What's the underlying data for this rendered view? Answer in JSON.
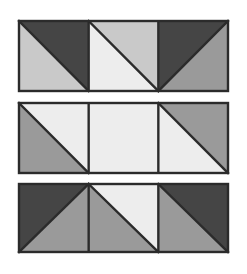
{
  "figure": {
    "canvas": {
      "width": 247,
      "height": 274,
      "background": "#ffffff"
    },
    "palette": {
      "outline": "#2b2b2b",
      "dark": "#454545",
      "mid": "#9a9a9a",
      "light": "#c9c9c9",
      "lighter": "#dcdcdc",
      "lightest": "#ededed",
      "background": "#ffffff"
    },
    "geometry": {
      "left": 19,
      "right": 228,
      "cell_width": 69.67,
      "stroke_width": 2.4,
      "bands": [
        {
          "name": "band-top",
          "top": 21,
          "bottom": 91
        },
        {
          "name": "band-middle",
          "top": 103,
          "bottom": 173
        },
        {
          "name": "band-bottom",
          "top": 184,
          "bottom": 252
        }
      ]
    },
    "bands": [
      {
        "name": "band-top",
        "index": 0,
        "cells": [
          {
            "name": "cell-top-1",
            "split": "tl-br",
            "upper_right_fill": "#454545",
            "lower_left_fill": "#c9c9c9",
            "description": "dark upper-left triangle over light lower-right triangle"
          },
          {
            "name": "cell-top-2",
            "split": "tl-br",
            "upper_right_fill": "#c9c9c9",
            "lower_left_fill": "#ededed",
            "description": "light upper-left triangle over lightest lower-right triangle"
          },
          {
            "name": "cell-top-3",
            "split": "tr-bl",
            "upper_left_fill": "#454545",
            "lower_right_fill": "#9a9a9a",
            "description": "dark upper-right triangle over mid-gray lower-left triangle"
          }
        ]
      },
      {
        "name": "band-middle",
        "index": 1,
        "cells": [
          {
            "name": "cell-middle-1",
            "split": "tl-br",
            "upper_right_fill": "#ededed",
            "lower_left_fill": "#9a9a9a",
            "description": "lightest upper-right triangle over mid-gray lower-left triangle"
          },
          {
            "name": "cell-middle-2",
            "split": "none",
            "fill": "#ededed",
            "description": "solid lightest square, no diagonal"
          },
          {
            "name": "cell-middle-3",
            "split": "tl-br",
            "upper_right_fill": "#9a9a9a",
            "lower_left_fill": "#ededed",
            "description": "mid-gray upper-right triangle over lightest lower-left triangle"
          }
        ]
      },
      {
        "name": "band-bottom",
        "index": 2,
        "cells": [
          {
            "name": "cell-bottom-1",
            "split": "tr-bl",
            "upper_left_fill": "#454545",
            "lower_right_fill": "#9a9a9a",
            "description": "dark left triangle with mid-gray triangle above-right"
          },
          {
            "name": "cell-bottom-2",
            "split": "tl-br",
            "upper_right_fill": "#ededed",
            "lower_left_fill": "#9a9a9a",
            "description": "lightest upper-left triangle over mid-gray lower-right triangle"
          },
          {
            "name": "cell-bottom-3",
            "split": "tl-br",
            "upper_right_fill": "#454545",
            "lower_left_fill": "#9a9a9a",
            "description": "dark upper-right triangle over mid-gray lower-left triangle"
          }
        ]
      }
    ]
  }
}
